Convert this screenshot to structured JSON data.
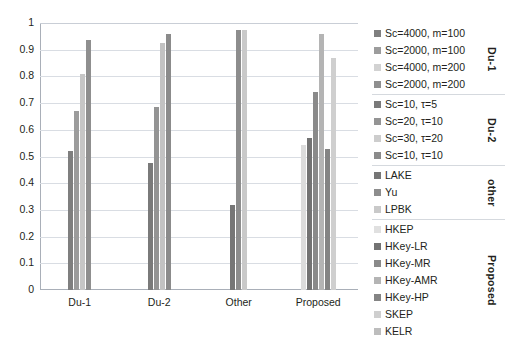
{
  "chart_data": {
    "type": "bar",
    "title": "",
    "xlabel": "",
    "ylabel": "",
    "ylim": [
      0,
      1
    ],
    "grid": true,
    "legend_position": "right",
    "yticks": [
      "1",
      "0.9",
      "0.8",
      "0.7",
      "0.6",
      "0.5",
      "0.4",
      "0.3",
      "0.2",
      "0.1",
      "0"
    ],
    "ytick_values": [
      1,
      0.9,
      0.8,
      0.7,
      0.6,
      0.5,
      0.4,
      0.3,
      0.2,
      0.1,
      0
    ],
    "categories": [
      "Du-1",
      "Du-2",
      "Other",
      "Proposed"
    ],
    "series": [
      {
        "name": "Sc=4000, m=100",
        "group": "Du-1",
        "color": "#7f7f7f",
        "category": "Du-1",
        "value": 0.52
      },
      {
        "name": "Sc=2000, m=100",
        "group": "Du-1",
        "color": "#9c9c9c",
        "category": "Du-1",
        "value": 0.67
      },
      {
        "name": "Sc=4000, m=200",
        "group": "Du-1",
        "color": "#c6c6c6",
        "category": "Du-1",
        "value": 0.81
      },
      {
        "name": "Sc=2000, m=200",
        "group": "Du-1",
        "color": "#8f8f8f",
        "category": "Du-1",
        "value": 0.935
      },
      {
        "name": "Sc=10, τ=5",
        "group": "Du-2",
        "color": "#7a7a7a",
        "category": "Du-2",
        "value": 0.475
      },
      {
        "name": "Sc=20, τ=10",
        "group": "Du-2",
        "color": "#949494",
        "category": "Du-2",
        "value": 0.685
      },
      {
        "name": "Sc=30, τ=20",
        "group": "Du-2",
        "color": "#c2c2c2",
        "category": "Du-2",
        "value": 0.925
      },
      {
        "name": "Sc=10, τ=10",
        "group": "Du-2",
        "color": "#8b8b8b",
        "category": "Du-2",
        "value": 0.96
      },
      {
        "name": "LAKE",
        "group": "other",
        "color": "#767676",
        "category": "Other",
        "value": 0.32
      },
      {
        "name": "Yu",
        "group": "other",
        "color": "#8d8d8d",
        "category": "Other",
        "value": 0.975
      },
      {
        "name": "LPBK",
        "group": "other",
        "color": "#c9c9c9",
        "category": "Other",
        "value": 0.975
      },
      {
        "name": "HKEP",
        "group": "Proposed",
        "color": "#dcdcdc",
        "category": "Proposed",
        "value": 0.545
      },
      {
        "name": "HKey-LR",
        "group": "Proposed",
        "color": "#737373",
        "category": "Proposed",
        "value": 0.57
      },
      {
        "name": "HKey-MR",
        "group": "Proposed",
        "color": "#8a8a8a",
        "category": "Proposed",
        "value": 0.74
      },
      {
        "name": "HKey-AMR",
        "group": "Proposed",
        "color": "#b4b4b4",
        "category": "Proposed",
        "value": 0.96
      },
      {
        "name": "HKey-HP",
        "group": "Proposed",
        "color": "#848484",
        "category": "Proposed",
        "value": 0.53
      },
      {
        "name": "SKEP",
        "group": "Proposed",
        "color": "#cfcfcf",
        "category": "Proposed",
        "value": 0.87
      },
      {
        "name": "KELR",
        "group": "Proposed",
        "color": "#bdbdbd",
        "category": "Proposed",
        "value": 0.0
      }
    ],
    "bars_by_category": {
      "Du-1": [
        0.52,
        0.67,
        0.81,
        0.935
      ],
      "Du-2": [
        0.475,
        0.685,
        0.925,
        0.96
      ],
      "Other": [
        0.32,
        0.975,
        0.975
      ],
      "Proposed": [
        0.545,
        0.57,
        0.74,
        0.96,
        0.53,
        0.87
      ]
    }
  },
  "axes": {
    "y": {
      "ticks": [
        "1",
        "0.9",
        "0.8",
        "0.7",
        "0.6",
        "0.5",
        "0.4",
        "0.3",
        "0.2",
        "0.1",
        "0"
      ]
    },
    "x": {
      "ticks": [
        "Du-1",
        "Du-2",
        "Other",
        "Proposed"
      ]
    }
  },
  "legend": {
    "groups": [
      {
        "title": "Du-1",
        "items": [
          {
            "label": "Sc=4000, m=100",
            "color": "#7f7f7f"
          },
          {
            "label": "Sc=2000, m=100",
            "color": "#9c9c9c"
          },
          {
            "label": "Sc=4000, m=200",
            "color": "#d2d2d2"
          },
          {
            "label": "Sc=2000, m=200",
            "color": "#8f8f8f"
          }
        ]
      },
      {
        "title": "Du-2",
        "items": [
          {
            "label": "Sc=10, τ=5",
            "color": "#7a7a7a"
          },
          {
            "label": "Sc=20, τ=10",
            "color": "#949494"
          },
          {
            "label": "Sc=30, τ=20",
            "color": "#cdcdcd"
          },
          {
            "label": "Sc=10, τ=10",
            "color": "#8b8b8b"
          }
        ]
      },
      {
        "title": "other",
        "items": [
          {
            "label": "LAKE",
            "color": "#767676"
          },
          {
            "label": "Yu",
            "color": "#8d8d8d"
          },
          {
            "label": "LPBK",
            "color": "#c9c9c9"
          }
        ]
      },
      {
        "title": "Proposed",
        "items": [
          {
            "label": "HKEP",
            "color": "#e0e0e0"
          },
          {
            "label": "HKey-LR",
            "color": "#737373"
          },
          {
            "label": "HKey-MR",
            "color": "#8a8a8a"
          },
          {
            "label": "HKey-AMR",
            "color": "#b4b4b4"
          },
          {
            "label": "HKey-HP",
            "color": "#848484"
          },
          {
            "label": "SKEP",
            "color": "#cfcfcf"
          },
          {
            "label": "KELR",
            "color": "#bdbdbd"
          }
        ]
      }
    ]
  },
  "style": {
    "gridline_color": "#d9dde3",
    "axis_color": "#a9afb8",
    "text_color": "#231f20",
    "background": "#ffffff"
  }
}
